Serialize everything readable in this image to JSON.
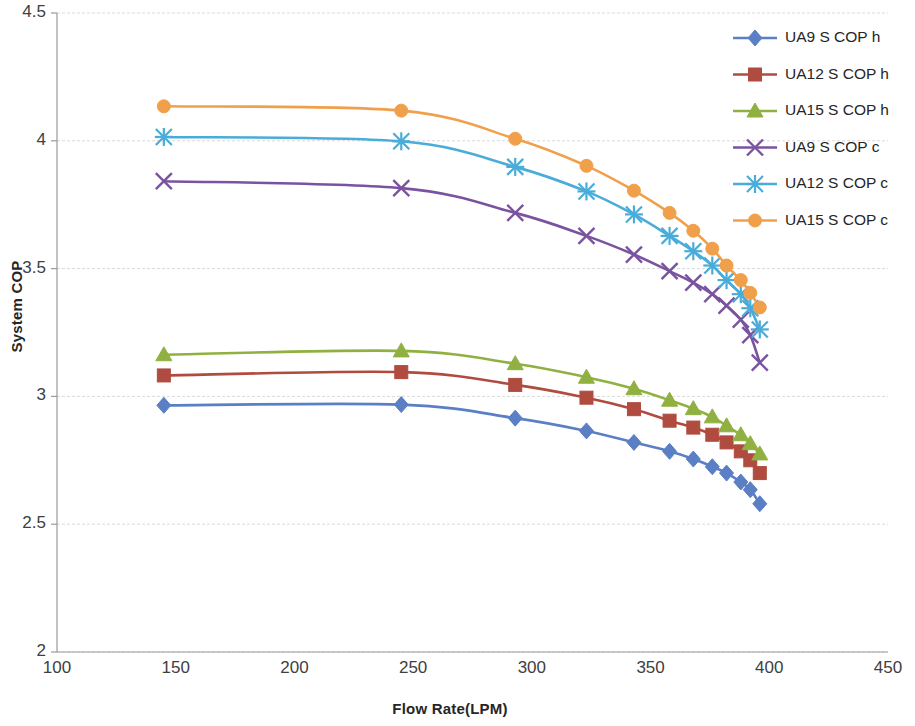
{
  "chart_data": {
    "type": "line",
    "title": "",
    "xlabel": "Flow Rate(LPM)",
    "ylabel": "System COP",
    "xlim": [
      100,
      450
    ],
    "ylim": [
      2,
      4.5
    ],
    "xticks": [
      100,
      150,
      200,
      250,
      300,
      350,
      400,
      450
    ],
    "yticks": [
      2,
      2.5,
      3,
      3.5,
      4,
      4.5
    ],
    "xtick_labels": [
      "100",
      "150",
      "200",
      "250",
      "300",
      "350",
      "400",
      "450"
    ],
    "ytick_labels": [
      "2",
      "2.5",
      "3",
      "3.5",
      "4",
      "4.5"
    ],
    "grid": "horizontal",
    "legend_position": "top-right",
    "series": [
      {
        "name": "UA9 S COP h",
        "color": "#5b7fc4",
        "marker": "diamond",
        "x": [
          145,
          245,
          293,
          323,
          343,
          358,
          368,
          376,
          382,
          388,
          392,
          396
        ],
        "y": [
          2.965,
          2.968,
          2.915,
          2.865,
          2.82,
          2.785,
          2.755,
          2.725,
          2.7,
          2.665,
          2.635,
          2.58
        ]
      },
      {
        "name": "UA12 S COP h",
        "color": "#b04b40",
        "marker": "square",
        "x": [
          145,
          245,
          293,
          323,
          343,
          358,
          368,
          376,
          382,
          388,
          392,
          396
        ],
        "y": [
          3.082,
          3.095,
          3.045,
          2.995,
          2.95,
          2.905,
          2.878,
          2.85,
          2.82,
          2.785,
          2.75,
          2.7
        ]
      },
      {
        "name": "UA15 S COP h",
        "color": "#90b141",
        "marker": "triangle",
        "x": [
          145,
          245,
          293,
          323,
          343,
          358,
          368,
          376,
          382,
          388,
          392,
          396
        ],
        "y": [
          3.163,
          3.178,
          3.128,
          3.075,
          3.03,
          2.985,
          2.952,
          2.92,
          2.885,
          2.85,
          2.815,
          2.775
        ]
      },
      {
        "name": "UA9 S COP c",
        "color": "#7a53a0",
        "marker": "x",
        "x": [
          145,
          245,
          293,
          323,
          343,
          358,
          368,
          376,
          382,
          388,
          392,
          396
        ],
        "y": [
          3.842,
          3.815,
          3.718,
          3.628,
          3.555,
          3.49,
          3.445,
          3.4,
          3.355,
          3.3,
          3.24,
          3.132
        ]
      },
      {
        "name": "UA12 S COP c",
        "color": "#49acd9",
        "marker": "asterisk",
        "x": [
          145,
          245,
          293,
          323,
          343,
          358,
          368,
          376,
          382,
          388,
          392,
          396
        ],
        "y": [
          4.015,
          3.998,
          3.898,
          3.802,
          3.712,
          3.628,
          3.568,
          3.512,
          3.455,
          3.4,
          3.345,
          3.262
        ]
      },
      {
        "name": "UA15 S COP c",
        "color": "#f0a04b",
        "marker": "circle",
        "x": [
          145,
          245,
          293,
          323,
          343,
          358,
          368,
          376,
          382,
          388,
          392,
          396
        ],
        "y": [
          4.135,
          4.118,
          4.008,
          3.902,
          3.805,
          3.718,
          3.648,
          3.578,
          3.512,
          3.455,
          3.405,
          3.348
        ]
      }
    ]
  }
}
